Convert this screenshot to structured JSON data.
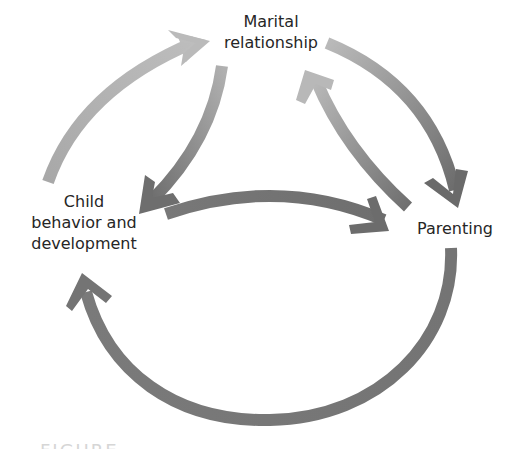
{
  "diagram": {
    "type": "cyclic relationship diagram",
    "nodes": {
      "marital": {
        "lines": [
          "Marital",
          "relationship"
        ]
      },
      "child": {
        "lines": [
          "Child",
          "behavior and",
          "development"
        ]
      },
      "parenting": {
        "lines": [
          "Parenting"
        ]
      }
    },
    "edges": [
      {
        "from": "child",
        "to": "marital",
        "path": "outer-left arc"
      },
      {
        "from": "marital",
        "to": "child",
        "path": "inner-left arc"
      },
      {
        "from": "marital",
        "to": "parenting",
        "path": "outer-right arc"
      },
      {
        "from": "parenting",
        "to": "marital",
        "path": "inner-right arc"
      },
      {
        "from": "child",
        "to": "parenting",
        "path": "middle arc"
      },
      {
        "from": "parenting",
        "to": "child",
        "path": "bottom arc"
      }
    ],
    "colors": {
      "arrow_light": "#b4b4b4",
      "arrow_mid": "#8c8c8c",
      "arrow_dark": "#6e6e6e",
      "text": "#262626",
      "background": "#ffffff"
    }
  },
  "caption": {
    "visible_text": "FIGURE"
  }
}
